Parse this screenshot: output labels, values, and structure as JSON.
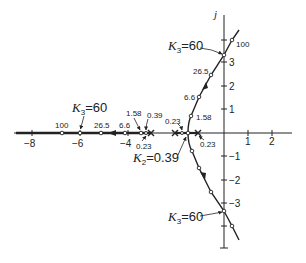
{
  "figure": {
    "axis_label_imag": "j",
    "real_ticks": [
      {
        "value": -8,
        "label": "−8"
      },
      {
        "value": -6,
        "label": "−6"
      },
      {
        "value": -4,
        "label": "−4"
      },
      {
        "value": 1,
        "label": "1"
      },
      {
        "value": 2,
        "label": "2"
      }
    ],
    "imag_ticks": [
      {
        "value": 3,
        "label": "3"
      },
      {
        "value": 2,
        "label": "2"
      },
      {
        "value": 1,
        "label": "1"
      },
      {
        "value": -1,
        "label": "−1"
      },
      {
        "value": -2,
        "label": "−2"
      },
      {
        "value": -3,
        "label": "−3"
      }
    ],
    "gain_labels": {
      "real_100": "100",
      "real_26_5": "26.5",
      "real_6_6": "6.6",
      "real_1_58": "1.58",
      "real_0_39": "0.39",
      "real_0_23_left": "0.23",
      "mid_0_23": "0.23",
      "right_0_23": "0.23",
      "upper_1_58": "1.58",
      "upper_6_6": "6.6",
      "upper_26_5": "26.5",
      "upper_100": "100"
    },
    "annotations": {
      "k3_left": {
        "sym": "K",
        "sub": "3",
        "eq": "=60"
      },
      "k3_top": {
        "sym": "K",
        "sub": "3",
        "eq": "=60"
      },
      "k3_bottom": {
        "sym": "K",
        "sub": "3",
        "eq": "=60"
      },
      "k2": {
        "sym": "K",
        "sub": "2",
        "eq": "=0.39"
      }
    }
  }
}
